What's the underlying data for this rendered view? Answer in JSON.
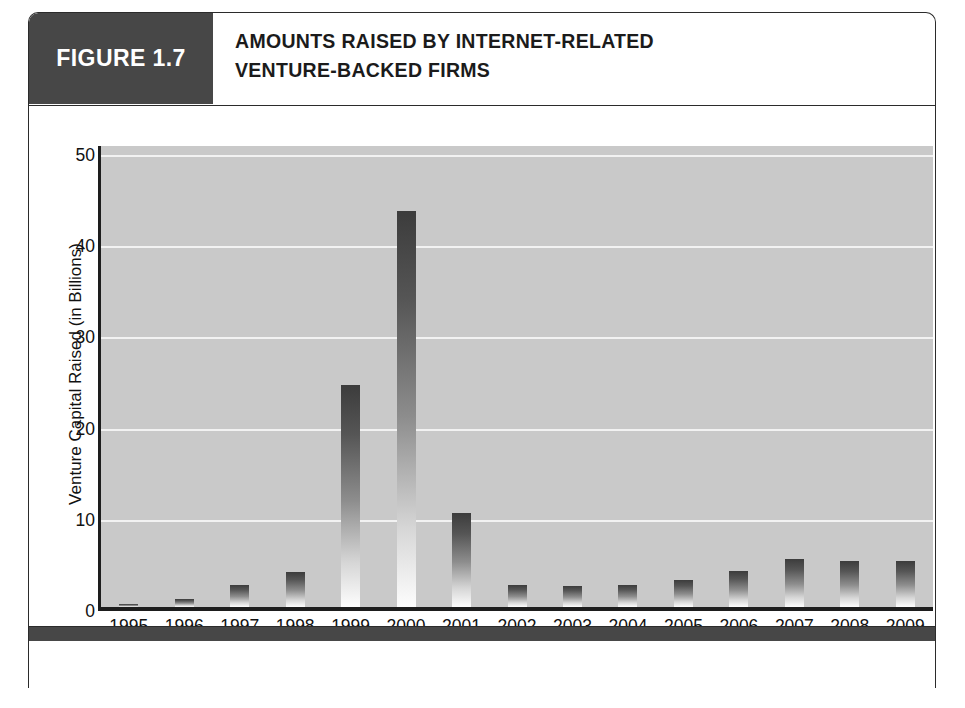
{
  "figure": {
    "badge_label": "FIGURE 1.7",
    "title_line1": "AMOUNTS RAISED BY INTERNET-RELATED",
    "title_line2": "VENTURE-BACKED FIRMS"
  },
  "colors": {
    "badge_background": "#474747",
    "badge_text": "#ffffff",
    "plot_background": "#c9c9c9",
    "gridline": "#f2f2f2",
    "axis": "#1d1d1d",
    "bar_top": "#3c3c3c",
    "bar_bottom": "#fdfdfd",
    "card_border": "#2b2b2b"
  },
  "chart_data": {
    "type": "bar",
    "title": "AMOUNTS RAISED BY INTERNET-RELATED VENTURE-BACKED FIRMS",
    "xlabel": "Year",
    "ylabel": "Venture Capital Raised (in Billions)",
    "categories": [
      "1995",
      "1996",
      "1997",
      "1998",
      "1999",
      "2000",
      "2001",
      "2002",
      "2003",
      "2004",
      "2005",
      "2006",
      "2007",
      "2008",
      "2009"
    ],
    "values": [
      0.3,
      0.9,
      2.4,
      3.8,
      24.4,
      43.4,
      10.3,
      2.4,
      2.3,
      2.4,
      3.0,
      3.9,
      5.3,
      5.1,
      5.1
    ],
    "ylim": [
      0,
      51
    ],
    "yticks": [
      0,
      10,
      20,
      30,
      40,
      50
    ],
    "ytick_labels": [
      "0",
      "10",
      "20",
      "30",
      "40",
      "50"
    ],
    "grid": true,
    "legend": "none"
  }
}
